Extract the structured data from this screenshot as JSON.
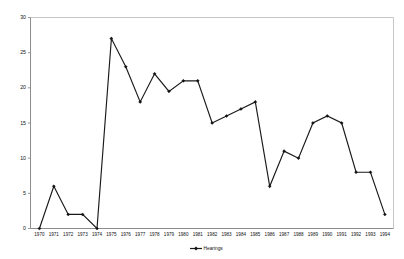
{
  "chart_data": {
    "type": "line",
    "title": "",
    "xlabel": "",
    "ylabel": "",
    "legend": [
      "Hearings"
    ],
    "legend_position": "bottom-center",
    "grid": false,
    "ylim": [
      0,
      30
    ],
    "ytick_values": [
      0,
      5,
      10,
      15,
      20,
      25,
      30
    ],
    "ytick_labels": [
      "0",
      "5",
      "10",
      "15",
      "20",
      "25",
      "30"
    ],
    "categories": [
      "1970",
      "1971",
      "1972",
      "1973",
      "1974",
      "1975",
      "1976",
      "1977",
      "1978",
      "1979",
      "1980",
      "1981",
      "1982",
      "1983",
      "1984",
      "1985",
      "1986",
      "1987",
      "1988",
      "1989",
      "1990",
      "1991",
      "1992",
      "1993",
      "1994"
    ],
    "series": [
      {
        "name": "Hearings",
        "color": "#1a1a1a",
        "marker": "diamond",
        "values": [
          0,
          6,
          2,
          2,
          0,
          27,
          23,
          18,
          22,
          19.5,
          21,
          21,
          15,
          16,
          17,
          18,
          6,
          11,
          10,
          15,
          16,
          15,
          8,
          8,
          2
        ]
      }
    ]
  },
  "legend": {
    "entries": [
      {
        "label": "Hearings"
      }
    ]
  },
  "axes": {
    "y_axis_name": "y-axis",
    "x_axis_name": "x-axis"
  }
}
